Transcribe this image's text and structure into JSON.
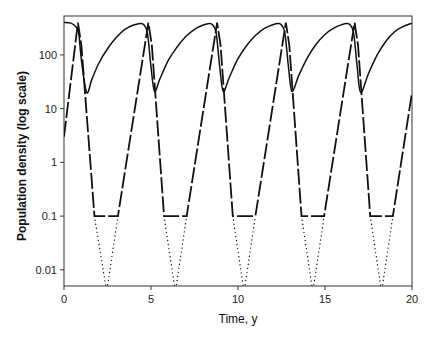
{
  "chart_data": {
    "type": "line",
    "title": "",
    "xlabel": "Time, y",
    "ylabel": "Population density (log scale)",
    "xlim": [
      0,
      20
    ],
    "ylim": [
      0.005,
      530
    ],
    "yscale": "log",
    "grid": false,
    "legend": null,
    "x_ticks": [
      0,
      5,
      10,
      15,
      20
    ],
    "x_tick_labels": [
      "0",
      "5",
      "10",
      "15",
      "20"
    ],
    "y_ticks": [
      0.01,
      0.1,
      1,
      10,
      100
    ],
    "y_tick_labels": [
      "0.01",
      "0.1",
      "1",
      "10",
      "100"
    ],
    "series": [
      {
        "name": "solid",
        "style": "solid",
        "points": [
          [
            0,
            400
          ],
          [
            0.4,
            390
          ],
          [
            0.7,
            330
          ],
          [
            0.85,
            250
          ],
          [
            1.0,
            80
          ],
          [
            1.3,
            20
          ],
          [
            1.6,
            35
          ],
          [
            2.0,
            70
          ],
          [
            2.5,
            130
          ],
          [
            3.0,
            210
          ],
          [
            3.5,
            300
          ],
          [
            4.0,
            360
          ],
          [
            4.4,
            385
          ],
          [
            4.6,
            360
          ],
          [
            4.8,
            250
          ],
          [
            5.0,
            60
          ],
          [
            5.2,
            21
          ],
          [
            5.5,
            35
          ],
          [
            6.0,
            80
          ],
          [
            6.5,
            140
          ],
          [
            7.0,
            220
          ],
          [
            7.5,
            300
          ],
          [
            8.0,
            360
          ],
          [
            8.35,
            385
          ],
          [
            8.55,
            360
          ],
          [
            8.75,
            250
          ],
          [
            8.95,
            60
          ],
          [
            9.15,
            21
          ],
          [
            9.5,
            38
          ],
          [
            10.0,
            85
          ],
          [
            10.5,
            150
          ],
          [
            11.0,
            230
          ],
          [
            11.5,
            310
          ],
          [
            12.0,
            365
          ],
          [
            12.3,
            385
          ],
          [
            12.5,
            360
          ],
          [
            12.7,
            250
          ],
          [
            12.9,
            60
          ],
          [
            13.1,
            21
          ],
          [
            13.5,
            42
          ],
          [
            14.0,
            90
          ],
          [
            14.5,
            160
          ],
          [
            15.0,
            240
          ],
          [
            15.5,
            315
          ],
          [
            16.0,
            370
          ],
          [
            16.25,
            385
          ],
          [
            16.45,
            360
          ],
          [
            16.65,
            250
          ],
          [
            16.85,
            60
          ],
          [
            17.05,
            20
          ],
          [
            17.5,
            45
          ],
          [
            18.0,
            100
          ],
          [
            18.5,
            180
          ],
          [
            19.0,
            270
          ],
          [
            19.5,
            340
          ],
          [
            20.0,
            390
          ]
        ]
      },
      {
        "name": "dashed",
        "style": "long-dash",
        "points": [
          [
            0,
            3
          ],
          [
            0.8,
            400
          ],
          [
            1.0,
            150
          ],
          [
            1.75,
            0.1
          ],
          [
            3.1,
            0.1
          ],
          [
            4.85,
            400
          ],
          [
            5.05,
            150
          ],
          [
            5.75,
            0.1
          ],
          [
            7.05,
            0.1
          ],
          [
            8.8,
            400
          ],
          [
            9.0,
            150
          ],
          [
            9.7,
            0.1
          ],
          [
            11.0,
            0.1
          ],
          [
            12.75,
            400
          ],
          [
            12.95,
            150
          ],
          [
            13.65,
            0.1
          ],
          [
            14.95,
            0.1
          ],
          [
            16.7,
            400
          ],
          [
            16.9,
            150
          ],
          [
            17.6,
            0.1
          ],
          [
            18.9,
            0.1
          ],
          [
            20.0,
            20
          ]
        ]
      },
      {
        "name": "dotted",
        "style": "dotted",
        "points": [
          [
            1.75,
            0.1
          ],
          [
            2.4,
            0.005
          ],
          [
            2.5,
            0.005
          ],
          [
            3.1,
            0.1
          ],
          [
            5.75,
            0.1
          ],
          [
            6.35,
            0.005
          ],
          [
            6.45,
            0.005
          ],
          [
            7.05,
            0.1
          ],
          [
            9.7,
            0.1
          ],
          [
            10.3,
            0.005
          ],
          [
            10.4,
            0.005
          ],
          [
            11.0,
            0.1
          ],
          [
            13.65,
            0.1
          ],
          [
            14.25,
            0.005
          ],
          [
            14.35,
            0.005
          ],
          [
            14.95,
            0.1
          ],
          [
            17.6,
            0.1
          ],
          [
            18.2,
            0.005
          ],
          [
            18.3,
            0.005
          ],
          [
            18.9,
            0.1
          ]
        ]
      }
    ],
    "layout": {
      "plot_left": 64,
      "plot_right": 412,
      "plot_top": 16,
      "plot_bottom": 286,
      "line_color": "#111111"
    }
  }
}
